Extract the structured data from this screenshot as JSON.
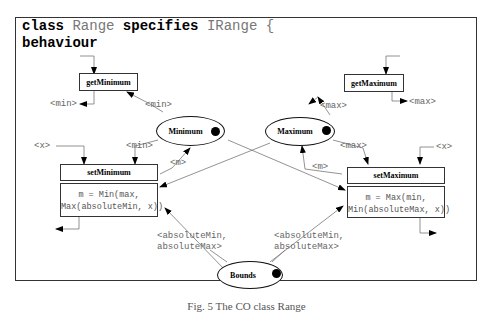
{
  "header": {
    "kw_class": "class",
    "class_name": "Range",
    "kw_specifies": "specifies",
    "interface_name": "IRange",
    "brace": "{",
    "section": "behaviour"
  },
  "operations": {
    "get_minimum": "getMinimum",
    "get_maximum": "getMaximum",
    "set_minimum": "setMinimum",
    "set_maximum": "setMaximum"
  },
  "code": {
    "set_minimum_line1": "m = Min(max,",
    "set_minimum_line2": "Max(absoluteMin, x))",
    "set_maximum_line1": "m = Max(min,",
    "set_maximum_line2": "Min(absoluteMax, x))"
  },
  "states": {
    "minimum": "Minimum",
    "maximum": "Maximum",
    "bounds": "Bounds"
  },
  "labels": {
    "min": "<min>",
    "max": "<max>",
    "x": "<x>",
    "m": "<m>",
    "bounds_line1": "<absoluteMin,",
    "bounds_line2": "absoluteMax>"
  },
  "caption": "Fig. 5 The CO class Range"
}
